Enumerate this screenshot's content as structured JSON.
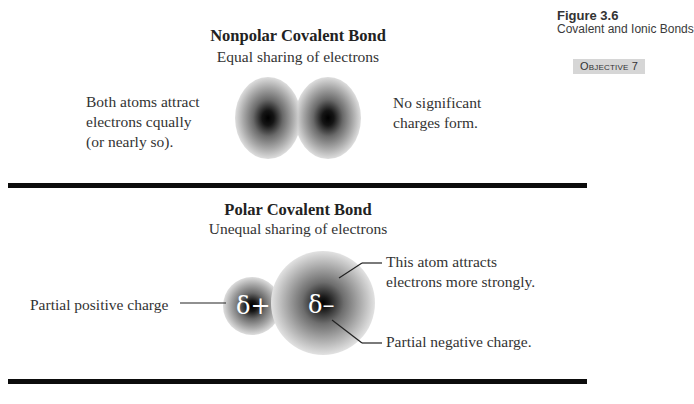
{
  "figure": {
    "number": "Figure 3.6",
    "caption": "Covalent and Ionic Bonds",
    "objective": "Objective 7"
  },
  "nonpolar": {
    "title": "Nonpolar Covalent Bond",
    "subtitle": "Equal sharing of electrons",
    "left_note": [
      "Both atoms attract",
      "electrons cqually",
      "(or nearly so)."
    ],
    "right_note": [
      "No significant",
      "charges form."
    ]
  },
  "polar": {
    "title": "Polar Covalent Bond",
    "subtitle": "Unequal sharing of electrons",
    "left_label": "Partial positive charge",
    "upper_right_note": [
      "This atom attracts",
      "electrons more strongly."
    ],
    "lower_right_note": "Partial negative charge.",
    "small_atom_symbol": "δ+",
    "large_atom_symbol": "δ–"
  },
  "colors": {
    "rule": "#0c0c0c",
    "objective_bg": "#d6d6d6",
    "electron_cloud_core": "#000000",
    "electron_cloud_edge": "#d8d8d8"
  }
}
